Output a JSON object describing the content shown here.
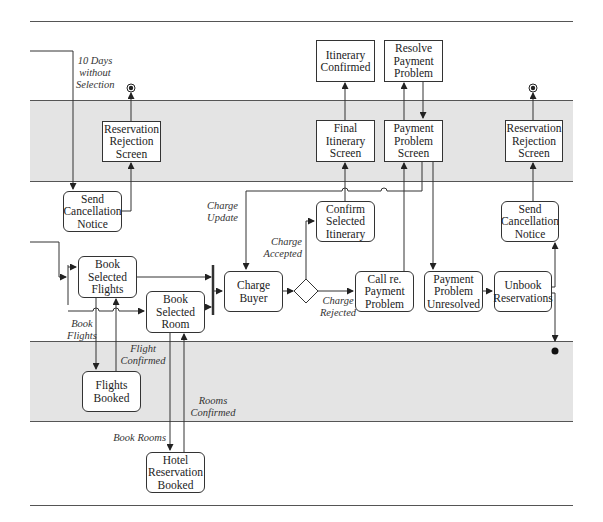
{
  "diagram": {
    "type": "activity-swimlane",
    "lanes": [
      {
        "id": "lane-1",
        "shade": "white"
      },
      {
        "id": "lane-2",
        "shade": "gray"
      },
      {
        "id": "lane-3",
        "shade": "white"
      },
      {
        "id": "lane-4",
        "shade": "gray"
      },
      {
        "id": "lane-5",
        "shade": "white"
      }
    ],
    "colors": {
      "lane_gray": "#e4e4e4",
      "line": "#333333"
    },
    "nodes": {
      "itinerary_confirmed": "Itinerary\nConfirmed",
      "resolve_payment_problem": "Resolve\nPayment\nProblem",
      "reservation_rejection_screen_left": "Reservation\nRejection\nScreen",
      "final_itinerary_screen": "Final\nItinerary\nScreen",
      "payment_problem_screen": "Payment\nProblem\nScreen",
      "reservation_rejection_screen_right": "Reservation\nRejection\nScreen",
      "send_cancellation_notice_left": "Send\nCancellation\nNotice",
      "confirm_selected_itinerary": "Confirm\nSelected\nItinerary",
      "send_cancellation_notice_right": "Send\nCancellation\nNotice",
      "book_selected_flights": "Book\nSelected\nFlights",
      "book_selected_room": "Book\nSelected\nRoom",
      "charge_buyer": "Charge\nBuyer",
      "call_re_payment_problem": "Call re.\nPayment\nProblem",
      "payment_problem_unresolved": "Payment\nProblem\nUnresolved",
      "unbook_reservations": "Unbook\nReservations",
      "flights_booked": "Flights\nBooked",
      "hotel_reservation_booked": "Hotel\nReservation\nBooked"
    },
    "labels": {
      "ten_days": "10 Days\nwithout\nSelection",
      "charge_update": "Charge\nUpdate",
      "charge_accepted": "Charge\nAccepted",
      "charge_rejected": "Charge\nRejected",
      "book_flights": "Book\nFlights",
      "flight_confirmed": "Flight\nConfirmed",
      "rooms_confirmed": "Rooms\nConfirmed",
      "book_rooms": "Book Rooms"
    }
  }
}
